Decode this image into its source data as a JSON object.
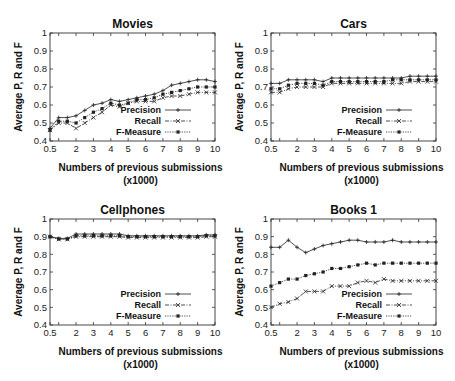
{
  "chart_data": [
    {
      "type": "line",
      "title": "Movies",
      "xlabel": "Numbers of previous submissions",
      "xlabel2": "(x1000)",
      "ylabel": "Average P, R and F",
      "xlim": [
        0.5,
        10
      ],
      "ylim": [
        0.4,
        1
      ],
      "xticks": [
        "0.5",
        "2",
        "3",
        "4",
        "5",
        "6",
        "7",
        "8",
        "9",
        "10"
      ],
      "xtick_values": [
        0.5,
        2,
        3,
        4,
        5,
        6,
        7,
        8,
        9,
        10
      ],
      "yticks": [
        "0.4",
        "0.5",
        "0.6",
        "0.7",
        "0.8",
        "0.9",
        "1"
      ],
      "ytick_values": [
        0.4,
        0.5,
        0.6,
        0.7,
        0.8,
        0.9,
        1
      ],
      "legend_position": "bottom-right",
      "x": [
        0.5,
        1,
        1.5,
        2,
        2.5,
        3,
        3.5,
        4,
        4.5,
        5,
        5.5,
        6,
        6.5,
        7,
        7.5,
        8,
        8.5,
        9,
        9.5,
        10
      ],
      "series": [
        {
          "name": "Precision",
          "marker": "plus",
          "dash": "solid",
          "values": [
            0.47,
            0.53,
            0.53,
            0.54,
            0.57,
            0.6,
            0.61,
            0.63,
            0.62,
            0.63,
            0.64,
            0.65,
            0.66,
            0.68,
            0.71,
            0.72,
            0.73,
            0.74,
            0.74,
            0.73
          ]
        },
        {
          "name": "Recall",
          "marker": "x",
          "dash": "dashdot",
          "values": [
            0.46,
            0.5,
            0.5,
            0.47,
            0.5,
            0.53,
            0.56,
            0.6,
            0.59,
            0.61,
            0.62,
            0.62,
            0.62,
            0.64,
            0.65,
            0.65,
            0.66,
            0.67,
            0.67,
            0.67
          ]
        },
        {
          "name": "F-Measure",
          "marker": "square",
          "dash": "dotted",
          "values": [
            0.46,
            0.51,
            0.51,
            0.5,
            0.53,
            0.56,
            0.58,
            0.61,
            0.6,
            0.61,
            0.63,
            0.63,
            0.64,
            0.66,
            0.67,
            0.68,
            0.69,
            0.7,
            0.7,
            0.7
          ]
        }
      ]
    },
    {
      "type": "line",
      "title": "Cars",
      "xlabel": "Numbers of previous submissions",
      "xlabel2": "(x1000)",
      "ylabel": "Average P, R and F",
      "xlim": [
        0.5,
        10
      ],
      "ylim": [
        0.4,
        1
      ],
      "xticks": [
        "0.5",
        "2",
        "3",
        "4",
        "5",
        "6",
        "7",
        "8",
        "9",
        "10"
      ],
      "xtick_values": [
        0.5,
        2,
        3,
        4,
        5,
        6,
        7,
        8,
        9,
        10
      ],
      "yticks": [
        "0.4",
        "0.5",
        "0.6",
        "0.7",
        "0.8",
        "0.9",
        "1"
      ],
      "ytick_values": [
        0.4,
        0.5,
        0.6,
        0.7,
        0.8,
        0.9,
        1
      ],
      "legend_position": "bottom-right",
      "x": [
        0.5,
        1,
        1.5,
        2,
        2.5,
        3,
        3.5,
        4,
        4.5,
        5,
        5.5,
        6,
        6.5,
        7,
        7.5,
        8,
        8.5,
        9,
        9.5,
        10
      ],
      "series": [
        {
          "name": "Precision",
          "marker": "plus",
          "dash": "solid",
          "values": [
            0.72,
            0.72,
            0.74,
            0.74,
            0.74,
            0.74,
            0.73,
            0.75,
            0.75,
            0.75,
            0.75,
            0.75,
            0.75,
            0.75,
            0.75,
            0.75,
            0.76,
            0.76,
            0.76,
            0.76
          ]
        },
        {
          "name": "Recall",
          "marker": "x",
          "dash": "dashdot",
          "values": [
            0.67,
            0.67,
            0.69,
            0.7,
            0.7,
            0.7,
            0.7,
            0.72,
            0.72,
            0.72,
            0.72,
            0.72,
            0.72,
            0.72,
            0.72,
            0.72,
            0.73,
            0.73,
            0.73,
            0.73
          ]
        },
        {
          "name": "F-Measure",
          "marker": "square",
          "dash": "dotted",
          "values": [
            0.69,
            0.69,
            0.71,
            0.72,
            0.72,
            0.72,
            0.71,
            0.73,
            0.73,
            0.73,
            0.73,
            0.73,
            0.73,
            0.73,
            0.74,
            0.74,
            0.74,
            0.74,
            0.74,
            0.74
          ]
        }
      ]
    },
    {
      "type": "line",
      "title": "Cellphones",
      "xlabel": "Numbers of previous submissions",
      "xlabel2": "(x1000)",
      "ylabel": "Average P, R and F",
      "xlim": [
        0.5,
        10
      ],
      "ylim": [
        0.4,
        1
      ],
      "xticks": [
        "0.5",
        "2",
        "3",
        "4",
        "5",
        "6",
        "7",
        "8",
        "9",
        "10"
      ],
      "xtick_values": [
        0.5,
        2,
        3,
        4,
        5,
        6,
        7,
        8,
        9,
        10
      ],
      "yticks": [
        "0.4",
        "0.5",
        "0.6",
        "0.7",
        "0.8",
        "0.9",
        "1"
      ],
      "ytick_values": [
        0.4,
        0.5,
        0.6,
        0.7,
        0.8,
        0.9,
        1
      ],
      "legend_position": "bottom-right",
      "x": [
        0.5,
        1,
        1.5,
        2,
        2.5,
        3,
        3.5,
        4,
        4.5,
        5,
        5.5,
        6,
        6.5,
        7,
        7.5,
        8,
        8.5,
        9,
        9.5,
        10
      ],
      "series": [
        {
          "name": "Precision",
          "marker": "plus",
          "dash": "solid",
          "values": [
            0.9,
            0.89,
            0.89,
            0.915,
            0.915,
            0.915,
            0.915,
            0.915,
            0.915,
            0.905,
            0.905,
            0.905,
            0.905,
            0.905,
            0.905,
            0.905,
            0.905,
            0.905,
            0.91,
            0.91
          ]
        },
        {
          "name": "Recall",
          "marker": "x",
          "dash": "dashdot",
          "values": [
            0.9,
            0.885,
            0.885,
            0.9,
            0.9,
            0.9,
            0.9,
            0.9,
            0.9,
            0.895,
            0.895,
            0.895,
            0.895,
            0.895,
            0.895,
            0.895,
            0.895,
            0.895,
            0.9,
            0.9
          ]
        },
        {
          "name": "F-Measure",
          "marker": "square",
          "dash": "dotted",
          "values": [
            0.9,
            0.887,
            0.887,
            0.905,
            0.905,
            0.905,
            0.905,
            0.905,
            0.905,
            0.9,
            0.9,
            0.9,
            0.9,
            0.9,
            0.9,
            0.9,
            0.9,
            0.9,
            0.905,
            0.905
          ]
        }
      ]
    },
    {
      "type": "line",
      "title": "Books 1",
      "xlabel": "Numbers of previous submissions",
      "xlabel2": "(x1000)",
      "ylabel": "Average P, R and F",
      "xlim": [
        0.5,
        10
      ],
      "ylim": [
        0.4,
        1
      ],
      "xticks": [
        "0.5",
        "2",
        "3",
        "4",
        "5",
        "6",
        "7",
        "8",
        "9",
        "10"
      ],
      "xtick_values": [
        0.5,
        2,
        3,
        4,
        5,
        6,
        7,
        8,
        9,
        10
      ],
      "yticks": [
        "0.4",
        "0.5",
        "0.6",
        "0.7",
        "0.8",
        "0.9",
        "1"
      ],
      "ytick_values": [
        0.4,
        0.5,
        0.6,
        0.7,
        0.8,
        0.9,
        1
      ],
      "legend_position": "bottom-right",
      "x": [
        0.5,
        1,
        1.5,
        2,
        2.5,
        3,
        3.5,
        4,
        4.5,
        5,
        5.5,
        6,
        6.5,
        7,
        7.5,
        8,
        8.5,
        9,
        9.5,
        10
      ],
      "series": [
        {
          "name": "Precision",
          "marker": "plus",
          "dash": "solid",
          "values": [
            0.84,
            0.84,
            0.88,
            0.84,
            0.81,
            0.83,
            0.85,
            0.86,
            0.87,
            0.88,
            0.88,
            0.87,
            0.87,
            0.87,
            0.88,
            0.87,
            0.87,
            0.87,
            0.87,
            0.87
          ]
        },
        {
          "name": "Recall",
          "marker": "x",
          "dash": "dashdot",
          "values": [
            0.5,
            0.52,
            0.53,
            0.55,
            0.59,
            0.59,
            0.59,
            0.62,
            0.62,
            0.62,
            0.64,
            0.65,
            0.64,
            0.66,
            0.65,
            0.65,
            0.65,
            0.65,
            0.65,
            0.65
          ]
        },
        {
          "name": "F-Measure",
          "marker": "square",
          "dash": "dotted",
          "values": [
            0.62,
            0.64,
            0.66,
            0.66,
            0.68,
            0.69,
            0.7,
            0.72,
            0.72,
            0.73,
            0.74,
            0.75,
            0.74,
            0.75,
            0.75,
            0.75,
            0.75,
            0.75,
            0.75,
            0.75
          ]
        }
      ]
    }
  ]
}
